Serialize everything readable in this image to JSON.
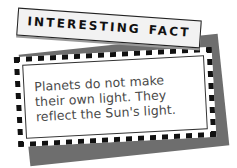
{
  "fact_box": {
    "header": {
      "word1": "INTERESTING",
      "word2": "FACT"
    },
    "body": {
      "line1": "Planets do not make",
      "line2": "their own light. They",
      "line3": "reflect the Sun's light."
    },
    "colors": {
      "border_check": "#111111",
      "shadow": "#6e6e6e",
      "card_bg": "#ffffff",
      "header_bg": "#f2f2f2",
      "text": "#4a4a4a"
    }
  }
}
